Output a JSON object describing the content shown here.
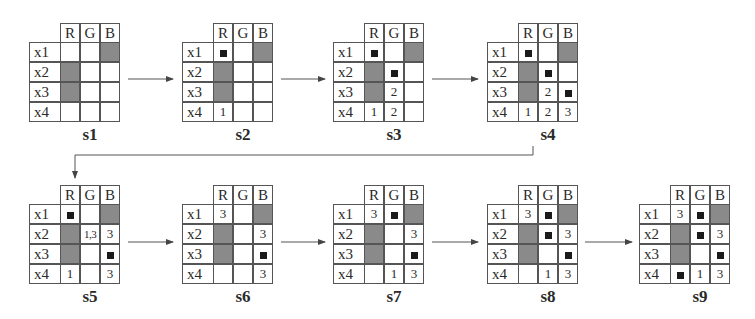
{
  "columns": [
    "R",
    "G",
    "B"
  ],
  "rows": [
    "x1",
    "x2",
    "x3",
    "x4"
  ],
  "colors": {
    "shaded": "#8a8a8a",
    "marker": "#1a1a1a",
    "line": "#555555"
  },
  "states": [
    {
      "label": "s1",
      "cells": [
        [
          "",
          "",
          "#"
        ],
        [
          "#",
          "",
          ""
        ],
        [
          "#",
          "",
          ""
        ],
        [
          "",
          "",
          ""
        ]
      ]
    },
    {
      "label": "s2",
      "cells": [
        [
          "■",
          "",
          "#"
        ],
        [
          "#",
          "",
          ""
        ],
        [
          "#",
          "",
          ""
        ],
        [
          "1",
          "",
          ""
        ]
      ]
    },
    {
      "label": "s3",
      "cells": [
        [
          "■",
          "",
          "#"
        ],
        [
          "#",
          "■",
          ""
        ],
        [
          "#",
          "2",
          ""
        ],
        [
          "1",
          "2",
          ""
        ]
      ]
    },
    {
      "label": "s4",
      "cells": [
        [
          "■",
          "",
          "#"
        ],
        [
          "#",
          "■",
          ""
        ],
        [
          "#",
          "2",
          "■"
        ],
        [
          "1",
          "2",
          "3"
        ]
      ]
    },
    {
      "label": "s5",
      "cells": [
        [
          "■",
          "",
          "#"
        ],
        [
          "#",
          "1,3",
          "3"
        ],
        [
          "#",
          "",
          "■"
        ],
        [
          "1",
          "",
          "3"
        ]
      ]
    },
    {
      "label": "s6",
      "cells": [
        [
          "3",
          "",
          "#"
        ],
        [
          "#",
          "",
          "3"
        ],
        [
          "#",
          "",
          "■"
        ],
        [
          "",
          "",
          "3"
        ]
      ]
    },
    {
      "label": "s7",
      "cells": [
        [
          "3",
          "■",
          "#"
        ],
        [
          "#",
          "",
          "3"
        ],
        [
          "#",
          "",
          "■"
        ],
        [
          "",
          "1",
          "3"
        ]
      ]
    },
    {
      "label": "s8",
      "cells": [
        [
          "3",
          "■",
          "#"
        ],
        [
          "#",
          "■",
          "3"
        ],
        [
          "#",
          "",
          "■"
        ],
        [
          "",
          "1",
          "3"
        ]
      ]
    },
    {
      "label": "s9",
      "cells": [
        [
          "3",
          "■",
          "#"
        ],
        [
          "#",
          "■",
          "3"
        ],
        [
          "#",
          "",
          "■"
        ],
        [
          "■",
          "1",
          "3"
        ]
      ]
    }
  ],
  "legend": {
    "shaded_cell": "#",
    "marker": "■"
  }
}
